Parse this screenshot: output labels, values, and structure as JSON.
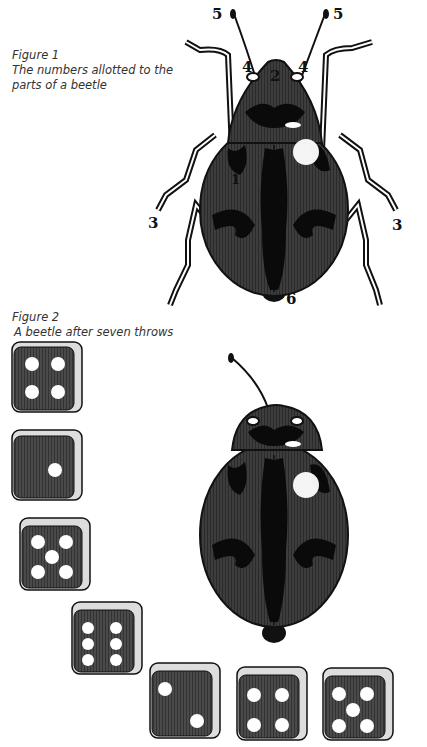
{
  "figure1": {
    "title": "Figure 1",
    "caption": "The numbers allotted to the parts of a beetle",
    "caption_line1": "The numbers allotted to the",
    "caption_line2": "parts of a beetle",
    "labels": {
      "body": "1",
      "head": "2",
      "leg_left": "3",
      "leg_right": "3",
      "eye_left": "4",
      "eye_right": "4",
      "feeler_left": "5",
      "feeler_right": "5",
      "tail": "6"
    }
  },
  "figure2": {
    "title": "Figure 2",
    "caption": "A beetle after seven throws",
    "throws": [
      4,
      1,
      5,
      6,
      2,
      4,
      5
    ]
  },
  "colors": {
    "beetle_body": "#3d3d3d",
    "beetle_marking": "#0a0a0a",
    "die_face": "#4a4a4a",
    "pip": "#ffffff",
    "caption_text": "#333333"
  }
}
